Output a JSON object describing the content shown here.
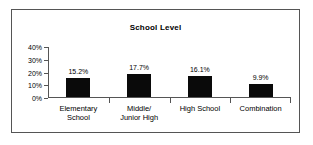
{
  "chart_data": {
    "type": "bar",
    "title": "School Level",
    "xlabel": "",
    "ylabel": "",
    "categories": [
      "Elementary School",
      "Middle/ Junior High",
      "High School",
      "Combination"
    ],
    "category_lines": [
      [
        "Elementary",
        "School"
      ],
      [
        "Middle/",
        "Junior High"
      ],
      [
        "High School"
      ],
      [
        "Combination"
      ]
    ],
    "values": [
      15.2,
      17.7,
      16.1,
      9.9
    ],
    "value_labels": [
      "15.2%",
      "17.7%",
      "16.1%",
      "9.9%"
    ],
    "ylim": [
      0,
      40
    ],
    "yticks": [
      0,
      10,
      20,
      30,
      40
    ],
    "ytick_labels": [
      "0%",
      "10%",
      "20%",
      "30%",
      "40%"
    ],
    "grid": false,
    "legend": "none",
    "bar_color": "#0a0a0a",
    "axis_color": "#555555",
    "background_color": "#ffffff"
  }
}
